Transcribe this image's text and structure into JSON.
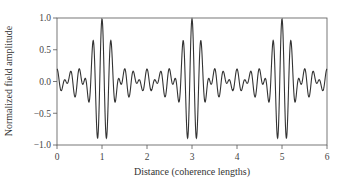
{
  "chart_data": {
    "type": "line",
    "title": "",
    "xlabel": "Distance (coherence lengths)",
    "ylabel": "Normalized field amplitude",
    "xlim": [
      0,
      6
    ],
    "ylim": [
      -1.0,
      1.0
    ],
    "x_ticks": [
      0,
      1,
      2,
      3,
      4,
      5,
      6
    ],
    "x_tick_labels": [
      "0",
      "1",
      "2",
      "3",
      "4",
      "5",
      "6"
    ],
    "y_ticks": [
      1.0,
      0.5,
      0.0,
      -0.5,
      -1.0
    ],
    "y_tick_labels": [
      "1.0",
      "0.5",
      "0.0",
      "−0.5",
      "−1.0"
    ],
    "grid": false,
    "legend": null,
    "model": {
      "carrier_cycles_per_unit": 5,
      "component_spacing": 0.5,
      "n_components": 5,
      "peak_positions": [
        1,
        3,
        5
      ],
      "node_positions": [
        0,
        2,
        4,
        6
      ]
    },
    "envelope_samples": {
      "x": [
        0,
        0.25,
        0.5,
        0.75,
        1,
        1.25,
        1.5,
        1.75,
        2,
        2.5,
        3,
        3.5,
        4,
        4.5,
        5,
        5.5,
        6
      ],
      "amplitude": [
        0.2,
        0.24,
        0.62,
        0.9,
        1.0,
        0.9,
        0.62,
        0.24,
        0.2,
        0.62,
        1.0,
        0.62,
        0.2,
        0.62,
        1.0,
        0.62,
        0.2
      ]
    },
    "series": [
      {
        "name": "field",
        "color": "#333333"
      }
    ]
  }
}
